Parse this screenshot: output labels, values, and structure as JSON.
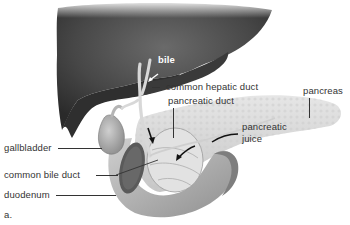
{
  "figure": {
    "panel_label": "a.",
    "labels": {
      "bile": "bile",
      "common_hepatic_duct": "common hepatic duct",
      "pancreatic_duct": "pancreatic duct",
      "pancreas": "pancreas",
      "gallbladder": "gallbladder",
      "pancreatic_juice_line1": "pancreatic",
      "pancreatic_juice_line2": "juice",
      "common_bile_duct": "common bile duct",
      "duodenum": "duodenum"
    },
    "colors": {
      "liver": "#4a4a4a",
      "liver_shadow": "#2e2e2e",
      "pancreas": "#d9d9d9",
      "duodenum": "#bdbdbd",
      "gallbladder": "#a8a8a8",
      "label_text": "#333333",
      "background": "#ffffff"
    }
  }
}
